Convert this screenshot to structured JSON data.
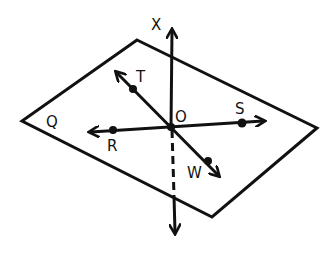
{
  "diagram": {
    "type": "geometry-plane-lines",
    "stroke_color": "#111111",
    "background": "#ffffff",
    "plane": {
      "label": "Q",
      "vertices": [
        [
          137,
          40
        ],
        [
          317,
          128
        ],
        [
          212,
          217
        ],
        [
          22,
          121
        ]
      ]
    },
    "center_point": {
      "label": "O",
      "x": 171,
      "y": 127
    },
    "lines": {
      "vertical": {
        "label": "X",
        "top_tip": [
          172,
          28
        ],
        "bottom_tip": [
          175,
          235
        ],
        "hidden_segment_label": ""
      },
      "horizontal": {
        "left_point_label": "R",
        "right_point_label": "S"
      },
      "diagonal": {
        "upper_point_label": "T",
        "lower_point_label": "W"
      }
    },
    "labels": {
      "X": "X",
      "Q": "Q",
      "T": "T",
      "O": "O",
      "S": "S",
      "R": "R",
      "W": "W"
    }
  }
}
